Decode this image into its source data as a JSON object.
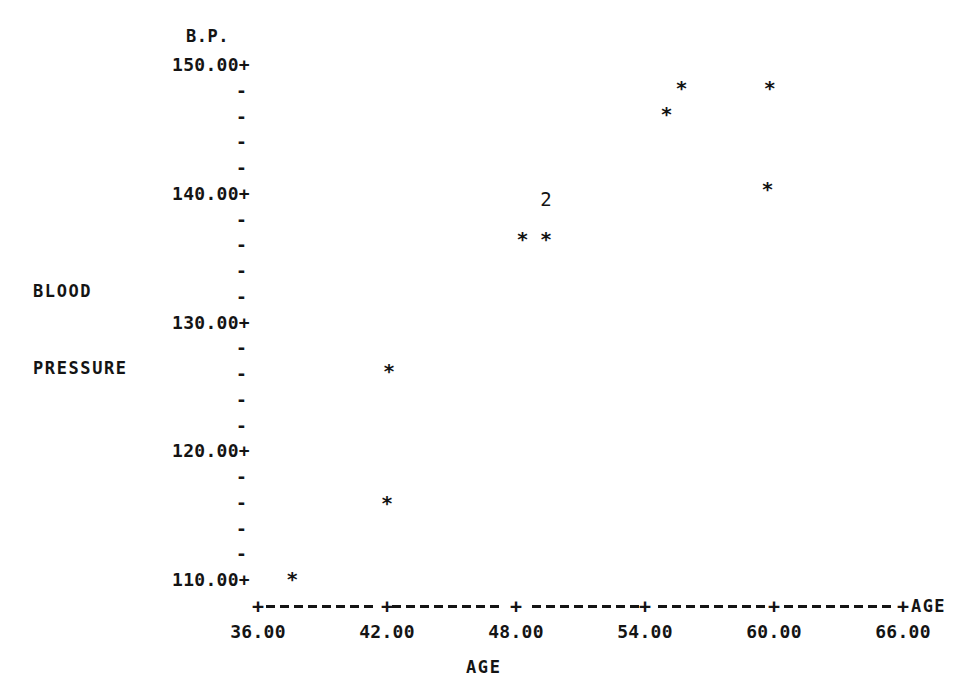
{
  "chart_data": {
    "type": "scatter",
    "title": "",
    "header_label": "B.P.",
    "xlabel": "AGE",
    "ylabel": "BLOOD PRESSURE",
    "ylabel_lines": [
      "BLOOD",
      "PRESSURE"
    ],
    "axis_end_label": "AGE",
    "xlim": [
      36.0,
      66.0
    ],
    "ylim": [
      110.0,
      150.0
    ],
    "grid": false,
    "legend": "none",
    "x_ticks": [
      "36.00",
      "42.00",
      "48.00",
      "54.00",
      "60.00",
      "66.00"
    ],
    "x_tick_values": [
      36.0,
      42.0,
      48.0,
      54.0,
      60.0,
      66.0
    ],
    "x_minor_per_interval": 0,
    "y_ticks": [
      "150.00+",
      "140.00+",
      "130.00+",
      "120.00+",
      "110.00+"
    ],
    "y_tick_values": [
      150.0,
      140.0,
      130.0,
      120.0,
      110.0
    ],
    "y_minor_marker": "-",
    "y_minor_per_interval": 4,
    "marker_symbol": "*",
    "marker_color": "#141414",
    "points": [
      {
        "x": 37.6,
        "y": 110.1,
        "count": 1,
        "label": ""
      },
      {
        "x": 42.0,
        "y": 116.0,
        "count": 1,
        "label": ""
      },
      {
        "x": 42.1,
        "y": 126.2,
        "count": 1,
        "label": ""
      },
      {
        "x": 48.3,
        "y": 136.5,
        "count": 1,
        "label": ""
      },
      {
        "x": 49.4,
        "y": 136.5,
        "count": 2,
        "label": "2"
      },
      {
        "x": 55.0,
        "y": 146.2,
        "count": 1,
        "label": ""
      },
      {
        "x": 55.7,
        "y": 148.2,
        "count": 1,
        "label": ""
      },
      {
        "x": 59.7,
        "y": 140.4,
        "count": 1,
        "label": ""
      },
      {
        "x": 59.8,
        "y": 148.2,
        "count": 1,
        "label": ""
      }
    ],
    "overlap_annotations": [
      {
        "x": 49.4,
        "y": 139.6,
        "text": "2"
      }
    ]
  }
}
